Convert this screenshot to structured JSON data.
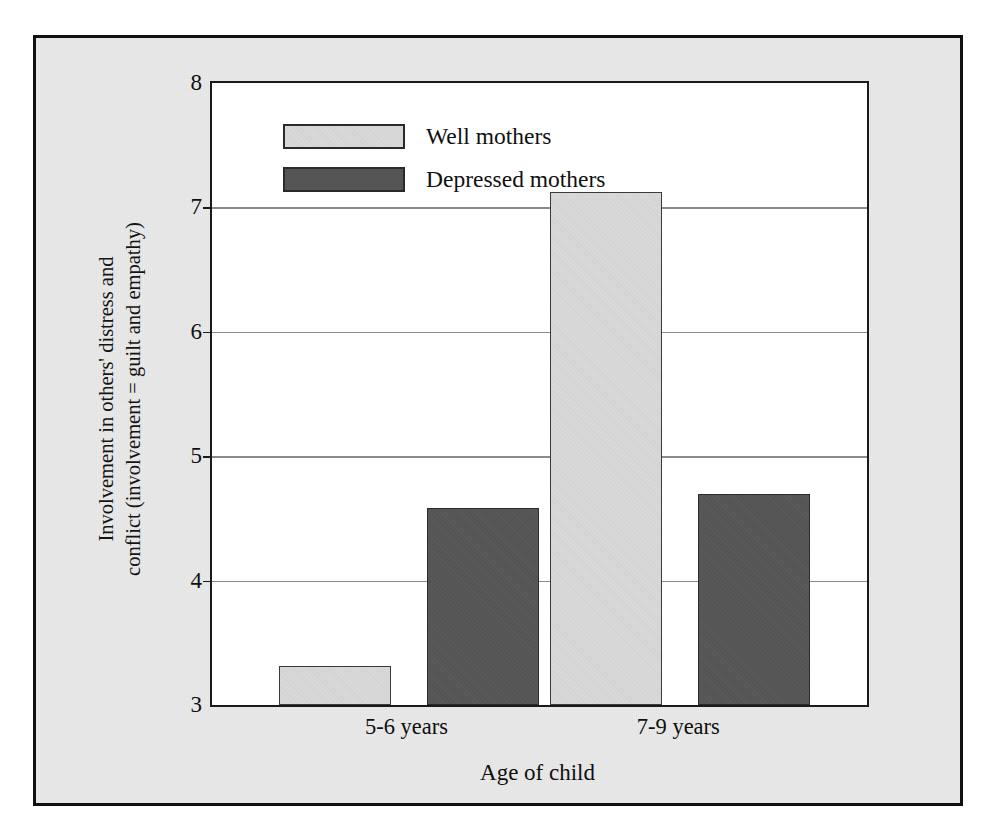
{
  "figure": {
    "background_color": "#e9e9e9",
    "frame_color": "#111111",
    "plot_background": "#ffffff"
  },
  "chart_data": {
    "type": "bar",
    "title": "",
    "xlabel": "Age of child",
    "ylabel": "Involvement in others' distress and conflict (involvement = guilt and empathy)",
    "ylabel_lines": [
      "Involvement in others' distress and",
      "conflict (involvement = guilt and empathy)"
    ],
    "categories": [
      "5-6 years",
      "7-9 years"
    ],
    "series": [
      {
        "name": "Well mothers",
        "color": "#d8d8d8",
        "values": [
          3.31,
          7.12
        ]
      },
      {
        "name": "Depressed mothers",
        "color": "#555555",
        "values": [
          4.58,
          4.7
        ]
      }
    ],
    "ylim": [
      3,
      8
    ],
    "yticks": [
      3,
      4,
      5,
      6,
      7,
      8
    ],
    "ytick_labels": [
      "3",
      "4",
      "5",
      "6",
      "7",
      "8"
    ],
    "grid": true,
    "grid_axis": "y",
    "legend_position": "upper-left-inside",
    "legend_entries": [
      "Well mothers",
      "Depressed mothers"
    ]
  }
}
